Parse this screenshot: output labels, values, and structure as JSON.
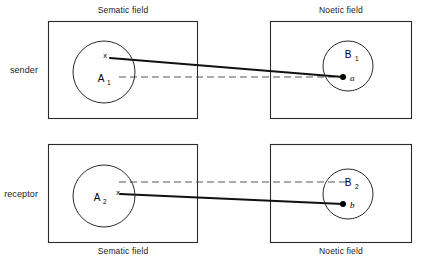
{
  "figure": {
    "width": 423,
    "height": 261
  },
  "colors": {
    "background": "#ffffff",
    "stroke": "#2b2b2b",
    "solid_link": "#111111",
    "dashed_link": "#444444",
    "text": "#000000"
  },
  "rows": {
    "sender": {
      "role_label": "sender",
      "top_label": "Sematic field",
      "top_label_right": "Noetic field",
      "left_set": {
        "name": "A",
        "subscript": "1",
        "marker": "x"
      },
      "right_set": {
        "name": "B",
        "subscript": "1",
        "point": "a"
      }
    },
    "receptor": {
      "role_label": "receptor",
      "bottom_label": "Sematic field",
      "bottom_label_right": "Noetic field",
      "left_set": {
        "name": "A",
        "subscript": "2",
        "marker": "x"
      },
      "right_set": {
        "name": "B",
        "subscript": "2",
        "point": "b"
      }
    }
  },
  "legend": {
    "solid_link_meaning": "solid connecting line",
    "dashed_link_meaning": "dashed reference line"
  }
}
